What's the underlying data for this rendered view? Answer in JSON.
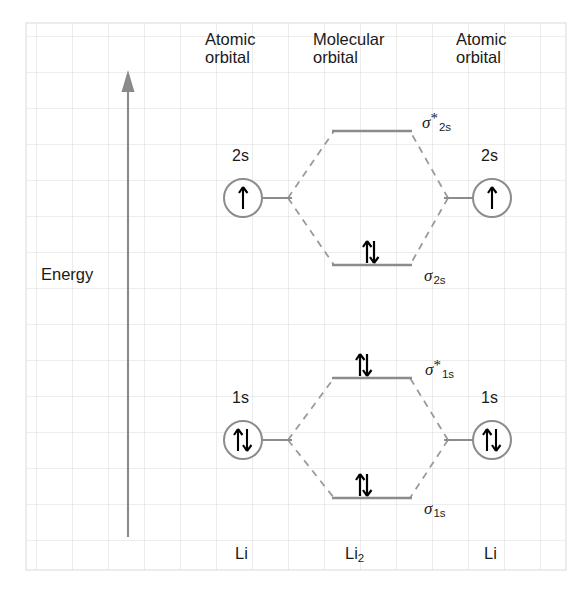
{
  "diagram": {
    "type": "molecular-orbital-diagram",
    "axis": {
      "label": "Energy",
      "direction": "up",
      "arrow_color": "#808080"
    },
    "columns": [
      {
        "id": "left-atomic",
        "header_line1": "Atomic",
        "header_line2": "orbital",
        "species": "Li"
      },
      {
        "id": "molecular",
        "header_line1": "Molecular",
        "header_line2": "orbital",
        "species_text": "Li",
        "species_sub": "2"
      },
      {
        "id": "right-atomic",
        "header_line1": "Atomic",
        "header_line2": "orbital",
        "species": "Li"
      }
    ],
    "atomic_orbitals": [
      {
        "id": "left-2s",
        "label": "2s",
        "electrons": "up",
        "count": 1,
        "side": "left"
      },
      {
        "id": "right-2s",
        "label": "2s",
        "electrons": "up",
        "count": 1,
        "side": "right"
      },
      {
        "id": "left-1s",
        "label": "1s",
        "electrons": "up-down",
        "count": 2,
        "side": "left"
      },
      {
        "id": "right-1s",
        "label": "1s",
        "electrons": "up-down",
        "count": 2,
        "side": "right"
      }
    ],
    "molecular_orbitals": [
      {
        "id": "sigma-star-2s",
        "symbol": "σ",
        "star": "*",
        "subscript": "2s",
        "electrons": "none",
        "count": 0,
        "kind": "antibonding"
      },
      {
        "id": "sigma-2s",
        "symbol": "σ",
        "star": "",
        "subscript": "2s",
        "electrons": "up-down",
        "count": 2,
        "kind": "bonding"
      },
      {
        "id": "sigma-star-1s",
        "symbol": "σ",
        "star": "*",
        "subscript": "1s",
        "electrons": "up-down",
        "count": 2,
        "kind": "antibonding"
      },
      {
        "id": "sigma-1s",
        "symbol": "σ",
        "star": "",
        "subscript": "1s",
        "electrons": "up-down",
        "count": 2,
        "kind": "bonding"
      }
    ],
    "colors": {
      "grid_line": "#d8d8d8",
      "level_line": "#8c8c8c",
      "dashed_line": "#9a9a9a",
      "arrow_electron": "#000000",
      "text": "#1a1a1a",
      "background": "#ffffff"
    },
    "grid": {
      "cell_size": 36,
      "columns": 15,
      "rows": 15
    }
  }
}
